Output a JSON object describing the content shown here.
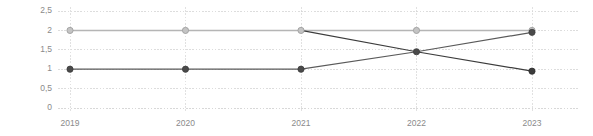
{
  "chart_data": {
    "type": "line",
    "title": "",
    "subtitle": "",
    "xlabel": "",
    "ylabel": "",
    "categories": [
      "2019",
      "2020",
      "2021",
      "2022",
      "2023"
    ],
    "x_tick_labels": [
      "2019",
      "2020",
      "2021",
      "2022",
      "2023"
    ],
    "y_tick_labels": [
      "2,5",
      "2",
      "1,5",
      "1",
      "0,5",
      "0"
    ],
    "y_tick_values": [
      2.5,
      2,
      1.5,
      1,
      0.5,
      0
    ],
    "ylim": [
      0,
      2.5
    ],
    "grid": true,
    "grid_style": "dotted",
    "legend": "none",
    "legend_position": "none",
    "series": [
      {
        "name": "series-flat-top",
        "color": "#b5b5b5",
        "marker_color": "#c4c4c4",
        "marker_edge": "#9a9a9a",
        "markers": true,
        "values": [
          2,
          2,
          2,
          2,
          2
        ]
      },
      {
        "name": "series-rising",
        "color": "#5a5a5a",
        "marker_color": "#4a4a4a",
        "marker_edge": "#3c3c3c",
        "markers": true,
        "values": [
          1,
          1,
          1,
          1.45,
          1.95
        ]
      },
      {
        "name": "series-falling",
        "color": "#3c3c3c",
        "marker_color": "#3c3c3c",
        "marker_edge": "#2e2e2e",
        "markers": false,
        "values": [
          null,
          null,
          2,
          1.45,
          0.95
        ]
      }
    ],
    "colors": {
      "gridline": "#cfcfcf",
      "tick_label": "#8a8a8a",
      "background": "#ffffff",
      "series_light": "#b5b5b5",
      "series_dark": "#3c3c3c"
    }
  },
  "layout": {
    "plot_left": 70,
    "plot_right": 532,
    "plot_top": 11,
    "plot_bottom": 108,
    "width": 593,
    "height": 136
  }
}
